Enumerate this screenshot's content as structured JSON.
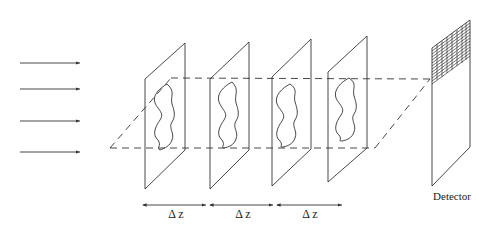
{
  "diagram": {
    "title": "",
    "incident_arrows": {
      "count": 4,
      "ys": [
        63,
        89,
        121,
        152
      ],
      "x_start": 20,
      "x_end": 80
    },
    "planes": [
      {
        "id": "plane-1",
        "left_x": 145,
        "right_x": 185,
        "top_left_y": 79,
        "top_right_y": 43,
        "bottom_left_y": 189,
        "bottom_right_y": 150
      },
      {
        "id": "plane-2",
        "left_x": 210,
        "right_x": 249,
        "top_left_y": 79,
        "top_right_y": 42,
        "bottom_left_y": 189,
        "bottom_right_y": 150
      },
      {
        "id": "plane-3",
        "left_x": 272,
        "right_x": 311,
        "top_left_y": 77,
        "top_right_y": 39,
        "bottom_left_y": 186,
        "bottom_right_y": 149
      },
      {
        "id": "plane-4",
        "left_x": 328,
        "right_x": 367,
        "top_left_y": 72,
        "top_right_y": 36,
        "bottom_left_y": 182,
        "bottom_right_y": 148
      }
    ],
    "spacing_labels": [
      {
        "text": "Δ z",
        "x1": 143,
        "x2": 206
      },
      {
        "text": "Δ z",
        "x1": 210,
        "x2": 273
      },
      {
        "text": "Δ z",
        "x1": 277,
        "x2": 342
      }
    ],
    "detector": {
      "label": "Detector",
      "left_x": 432,
      "right_x": 470,
      "top_left_y": 48,
      "top_right_y": 20,
      "bottom_left_y": 186,
      "bottom_right_y": 147
    },
    "colors": {
      "line": "#333333",
      "background": "#ffffff"
    }
  }
}
